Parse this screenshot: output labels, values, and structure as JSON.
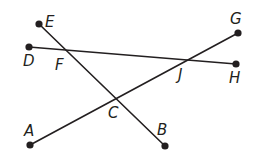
{
  "diagram": {
    "colors": {
      "line": "#231f20",
      "background": "#ffffff"
    },
    "points": {
      "E": {
        "x": 39,
        "y": 24,
        "label": "E",
        "lx": 45,
        "ly": 27,
        "endpoint": true
      },
      "D": {
        "x": 29,
        "y": 47,
        "label": "D",
        "lx": 23,
        "ly": 66,
        "endpoint": true
      },
      "G": {
        "x": 238,
        "y": 33,
        "label": "G",
        "lx": 230,
        "ly": 24,
        "endpoint": true
      },
      "H": {
        "x": 236,
        "y": 64,
        "label": "H",
        "lx": 229,
        "ly": 83,
        "endpoint": true
      },
      "A": {
        "x": 30,
        "y": 145,
        "label": "A",
        "lx": 24,
        "ly": 136,
        "endpoint": true
      },
      "B": {
        "x": 165,
        "y": 146,
        "label": "B",
        "lx": 157,
        "ly": 135,
        "endpoint": true
      },
      "F": {
        "x": 68,
        "y": 51,
        "label": "F",
        "lx": 55,
        "ly": 70,
        "endpoint": false
      },
      "J": {
        "x": 184,
        "y": 62,
        "label": "J",
        "lx": 178,
        "ly": 80,
        "endpoint": false
      },
      "C": {
        "x": 116,
        "y": 98,
        "label": "C",
        "lx": 108,
        "ly": 118,
        "endpoint": false
      }
    },
    "segments": [
      {
        "name": "DH",
        "from": "D",
        "to": "H"
      },
      {
        "name": "EB",
        "from": "E",
        "to": "B"
      },
      {
        "name": "AG",
        "from": "A",
        "to": "G"
      }
    ],
    "intersections": [
      {
        "name": "F",
        "of": [
          "DH",
          "EB"
        ]
      },
      {
        "name": "J",
        "of": [
          "DH",
          "AG"
        ]
      },
      {
        "name": "C",
        "of": [
          "EB",
          "AG"
        ]
      }
    ]
  }
}
